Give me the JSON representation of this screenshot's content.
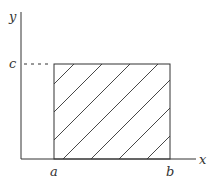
{
  "diagram": {
    "type": "shaded-rectangle-region",
    "axes": {
      "x_label": "x",
      "y_label": "y"
    },
    "ticks": {
      "x": [
        "a",
        "b"
      ],
      "y": [
        "c"
      ]
    },
    "region": {
      "x_from": "a",
      "x_to": "b",
      "y_from": "0",
      "y_to": "c",
      "fill": "diagonal-hatch"
    },
    "colors": {
      "stroke": "#333333",
      "background": "#ffffff"
    }
  }
}
